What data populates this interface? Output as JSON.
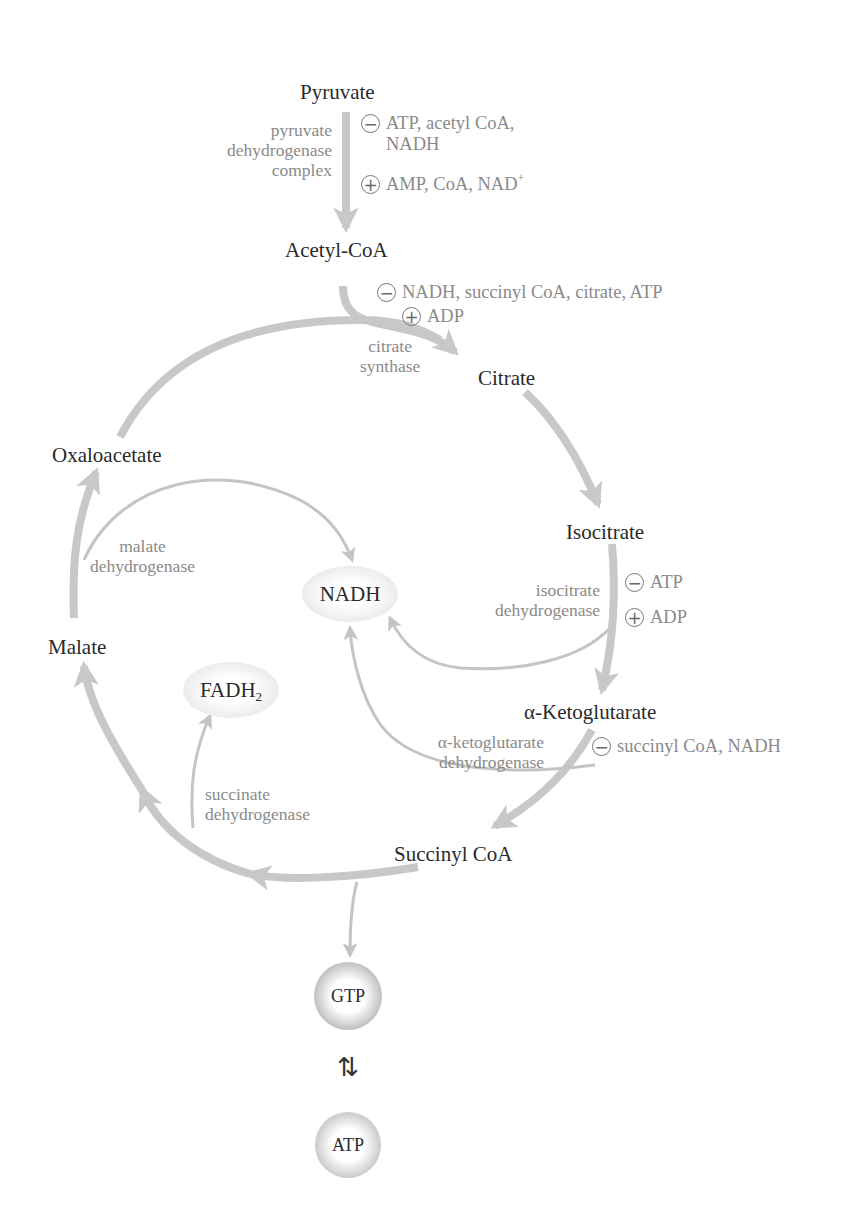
{
  "diagram": {
    "colors": {
      "arrow": "#c8c8c8",
      "metabolite_text": "#2a2a2a",
      "enzyme_text": "#8a8a8a",
      "oval_fill": "#e6e6e6",
      "gtp_rim": "#3c3c3c",
      "atp_rim": "#6a6a6a"
    },
    "metabolites": {
      "pyruvate": "Pyruvate",
      "acetyl_coa": "Acetyl-CoA",
      "citrate": "Citrate",
      "isocitrate": "Isocitrate",
      "alpha_ketoglutarate": "α-Ketoglutarate",
      "succinyl_coa": "Succinyl CoA",
      "malate": "Malate",
      "oxaloacetate": "Oxaloacetate"
    },
    "enzymes": {
      "pdh": [
        "pyruvate",
        "dehydrogenase",
        "complex"
      ],
      "citrate_synthase": [
        "citrate",
        "synthase"
      ],
      "isocitrate_dh": [
        "isocitrate",
        "dehydrogenase"
      ],
      "akg_dh": [
        "α-ketoglutarate",
        "dehydrogenase"
      ],
      "succinate_dh": [
        "succinate",
        "dehydrogenase"
      ],
      "malate_dh": [
        "malate",
        "dehydrogenase"
      ]
    },
    "regulators": {
      "pdh_inhibitors": {
        "sign": "−",
        "line1": "ATP, acetyl CoA,",
        "line2": "NADH"
      },
      "pdh_activators": {
        "sign": "+",
        "text": "AMP, CoA, NAD",
        "sup": "+"
      },
      "cs_inhibitors": {
        "sign": "−",
        "text": "NADH, succinyl CoA, citrate, ATP"
      },
      "cs_activators": {
        "sign": "+",
        "text": "ADP"
      },
      "idh_inhibitors": {
        "sign": "−",
        "text": "ATP"
      },
      "idh_activators": {
        "sign": "+",
        "text": "ADP"
      },
      "akgdh_inhibitors": {
        "sign": "−",
        "text": "succinyl CoA, NADH"
      }
    },
    "products": {
      "nadh": "NADH",
      "fadh2": {
        "base": "FADH",
        "sub": "2"
      },
      "gtp": "GTP",
      "atp": "ATP",
      "equilibrium_symbol": "⇅"
    }
  }
}
